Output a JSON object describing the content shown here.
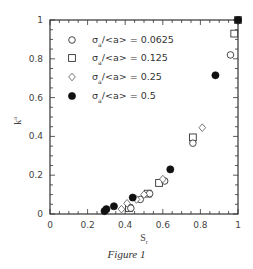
{
  "chart_data": {
    "type": "scatter",
    "title": "",
    "caption": "Figure 1",
    "xlabel": "S_r",
    "ylabel": "k_a",
    "xlim": [
      0,
      1
    ],
    "ylim": [
      0,
      1
    ],
    "xticks": [
      "0",
      "0.2",
      "0.4",
      "0.6",
      "0.8",
      "1"
    ],
    "yticks": [
      "0",
      "0.2",
      "0.4",
      "0.6",
      "0.8",
      "1"
    ],
    "grid": false,
    "legend_position": "upper left",
    "series": [
      {
        "name": "σa/<a> = 0.0625",
        "marker": "open-circle",
        "x": [
          0.43,
          0.48,
          0.53,
          0.61,
          0.76,
          0.96,
          1.0
        ],
        "y": [
          0.03,
          0.075,
          0.105,
          0.17,
          0.365,
          0.82,
          1.0
        ]
      },
      {
        "name": "σa/<a> = 0.125",
        "marker": "open-square",
        "x": [
          0.42,
          0.52,
          0.58,
          0.76,
          0.98,
          1.0
        ],
        "y": [
          0.03,
          0.105,
          0.16,
          0.395,
          0.93,
          1.0
        ]
      },
      {
        "name": "σa/<a> = 0.25",
        "marker": "open-diamond",
        "x": [
          0.38,
          0.41,
          0.46,
          0.5,
          0.6,
          0.81,
          1.0
        ],
        "y": [
          0.025,
          0.055,
          0.075,
          0.1,
          0.18,
          0.445,
          1.0
        ]
      },
      {
        "name": "σa/<a> = 0.5",
        "marker": "filled-circle",
        "x": [
          0.29,
          0.3,
          0.34,
          0.44,
          0.64,
          0.88,
          1.0
        ],
        "y": [
          0.015,
          0.025,
          0.04,
          0.085,
          0.23,
          0.715,
          1.0
        ]
      }
    ]
  },
  "legend": [
    {
      "label": "σ",
      "sub": "a",
      "rest": "/<a> = 0.0625"
    },
    {
      "label": "σ",
      "sub": "a",
      "rest": "/<a> = 0.125"
    },
    {
      "label": "σ",
      "sub": "a",
      "rest": "/<a> = 0.25"
    },
    {
      "label": "σ",
      "sub": "a",
      "rest": "/<a> = 0.5"
    }
  ],
  "axes": {
    "x_label_main": "S",
    "x_label_sub": "r",
    "y_label_main": "k",
    "y_label_sub": "a"
  },
  "figure_caption": "Figure 1"
}
